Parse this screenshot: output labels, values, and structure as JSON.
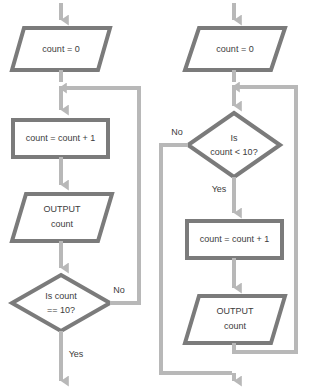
{
  "diagram": {
    "colors": {
      "shape_border": "#7b7b7b",
      "shape_fill": "#ffffff",
      "connector": "#b8b8b8",
      "text": "#3c3c3c",
      "background": "#ffffff"
    },
    "charts": [
      {
        "id": "left-flowchart",
        "name": "post-test-loop",
        "nodes": [
          {
            "id": "l-init",
            "type": "parallelogram",
            "text": "count = 0"
          },
          {
            "id": "l-incr",
            "type": "rectangle",
            "text": "count = count + 1"
          },
          {
            "id": "l-output",
            "type": "parallelogram",
            "text_line1": "OUTPUT",
            "text_line2": "count"
          },
          {
            "id": "l-cond",
            "type": "diamond",
            "text_line1": "Is count",
            "text_line2": "== 10?"
          }
        ],
        "branch_labels": {
          "no": "No",
          "yes": "Yes"
        }
      },
      {
        "id": "right-flowchart",
        "name": "pre-test-loop",
        "nodes": [
          {
            "id": "r-init",
            "type": "parallelogram",
            "text": "count = 0"
          },
          {
            "id": "r-cond",
            "type": "diamond",
            "text_line1": "Is",
            "text_line2": "count < 10?"
          },
          {
            "id": "r-incr",
            "type": "rectangle",
            "text": "count = count + 1"
          },
          {
            "id": "r-output",
            "type": "parallelogram",
            "text_line1": "OUTPUT",
            "text_line2": "count"
          }
        ],
        "branch_labels": {
          "no": "No",
          "yes": "Yes"
        }
      }
    ]
  }
}
